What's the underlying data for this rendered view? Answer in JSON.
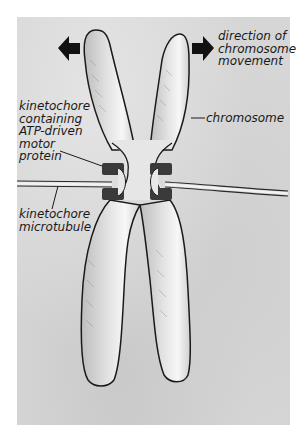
{
  "figure": {
    "colors": {
      "paper": "#d6d6d6",
      "border": "#ffffff",
      "chromosome_fill": "#ececec",
      "outline": "#1a1a1a",
      "motor": "#3a3a3a",
      "arrow": "#111111"
    },
    "labels": {
      "direction": "direction of\nchromosome\nmovement",
      "chromosome": "chromosome",
      "kinetochore_motor": "kinetochore\ncontaining\nATP-driven\nmotor\nprotein",
      "microtubule": "kinetochore\nmicrotubule"
    },
    "icons": {
      "left_arrow": "arrow-left-icon",
      "right_arrow": "arrow-right-icon"
    }
  }
}
